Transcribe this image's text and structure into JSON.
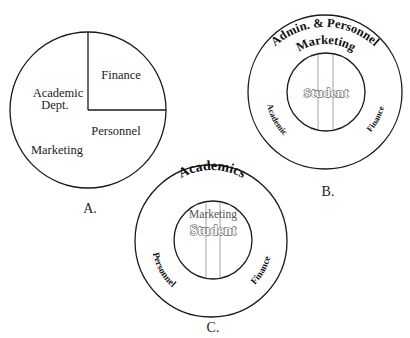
{
  "diagram_a": {
    "caption": "A.",
    "segments": {
      "finance": "Finance",
      "academic_line1": "Academic",
      "academic_line2": "Dept.",
      "personnel": "Personnel",
      "marketing": "Marketing"
    }
  },
  "diagram_b": {
    "caption": "B.",
    "outer_top_arc": "Admin. & Personnel",
    "inner_top_arc": "Marketing",
    "left_arc": "Academic",
    "right_arc": "Finance",
    "center": "Student"
  },
  "diagram_c": {
    "caption": "C.",
    "outer_top_arc": "Academics",
    "inner_label": "Marketing",
    "left_arc": "Personnel",
    "right_arc": "Finance",
    "center": "Student"
  },
  "colors": {
    "stroke": "#1a1a1a",
    "divider": "#9a9a9a",
    "background": "#ffffff"
  }
}
